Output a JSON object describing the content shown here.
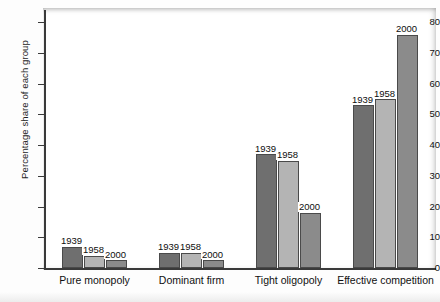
{
  "chart_data": {
    "type": "bar",
    "title": "",
    "xlabel": "",
    "ylabel": "Percentage share of each group",
    "ylim": [
      0,
      84
    ],
    "yticks": [
      0,
      10,
      20,
      30,
      40,
      50,
      60,
      70,
      80
    ],
    "grid": false,
    "legend_position": "none",
    "legend_as_bar_labels": true,
    "categories": [
      "Pure monopoly",
      "Dominant firm",
      "Tight oligopoly",
      "Effective competition"
    ],
    "series": [
      {
        "name": "1939",
        "values": [
          7,
          5,
          37,
          53
        ],
        "color": "#6f6f6f"
      },
      {
        "name": "1958",
        "values": [
          4,
          5,
          35,
          55
        ],
        "color": "#b4b4b4"
      },
      {
        "name": "2000",
        "values": [
          2.5,
          2.5,
          18,
          76
        ],
        "color": "#8b8b8b"
      }
    ],
    "bar_labels": [
      [
        "1939",
        "1958",
        "2000"
      ],
      [
        "1939",
        "1958",
        "2000"
      ],
      [
        "1939",
        "1958",
        "2000"
      ],
      [
        "1939",
        "1958",
        "2000"
      ]
    ]
  },
  "axis": {
    "y_title": "Percentage share of each group",
    "tick_labels": [
      "80",
      "70",
      "60",
      "50",
      "40",
      "30",
      "20",
      "10",
      "0"
    ]
  }
}
